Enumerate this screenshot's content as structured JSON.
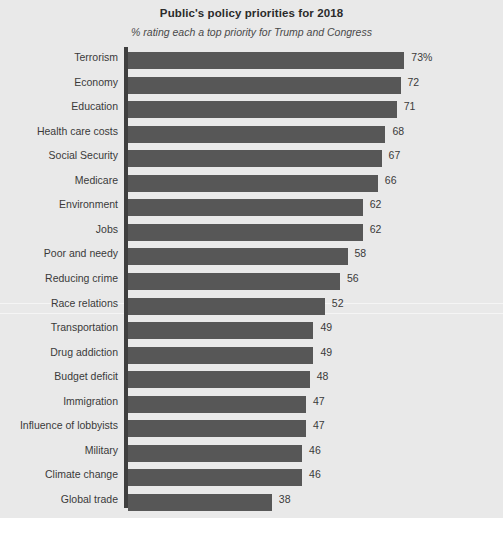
{
  "chart_data": {
    "type": "bar",
    "orientation": "horizontal",
    "title": "Public's policy priorities for 2018",
    "subtitle": "% rating each a top priority for Trump and Congress",
    "xlabel": "",
    "ylabel": "",
    "xlim": [
      0,
      73
    ],
    "grid": false,
    "legend": null,
    "value_suffix_first": "%",
    "bar_color": "#575757",
    "background_color": "#e9e9e9",
    "label_color": "#3a3a3a",
    "categories": [
      "Terrorism",
      "Economy",
      "Education",
      "Health care costs",
      "Social Security",
      "Medicare",
      "Environment",
      "Jobs",
      "Poor and needy",
      "Reducing crime",
      "Race relations",
      "Transportation",
      "Drug addiction",
      "Budget deficit",
      "Immigration",
      "Influence of lobbyists",
      "Military",
      "Climate change",
      "Global trade"
    ],
    "values": [
      73,
      72,
      71,
      68,
      67,
      66,
      62,
      62,
      58,
      56,
      52,
      49,
      49,
      48,
      47,
      47,
      46,
      46,
      38
    ],
    "value_labels": [
      "73%",
      "72",
      "71",
      "68",
      "67",
      "66",
      "62",
      "62",
      "58",
      "56",
      "52",
      "49",
      "49",
      "48",
      "47",
      "47",
      "46",
      "46",
      "38"
    ]
  }
}
